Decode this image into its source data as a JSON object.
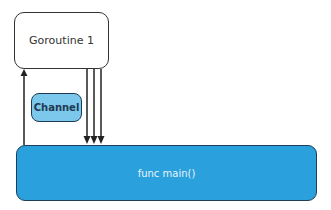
{
  "diagram": {
    "nodes": {
      "goroutine": {
        "label": "Goroutine 1",
        "fill": "#ffffff"
      },
      "channel": {
        "label": "Channel",
        "fill": "#7cc8ec"
      },
      "main": {
        "label": "func main()",
        "fill": "#2aa0dc"
      }
    },
    "edges": [
      {
        "from": "main",
        "to": "goroutine",
        "direction": "up",
        "count": 1
      },
      {
        "from": "goroutine",
        "to": "main",
        "direction": "down",
        "count": 3
      }
    ]
  }
}
